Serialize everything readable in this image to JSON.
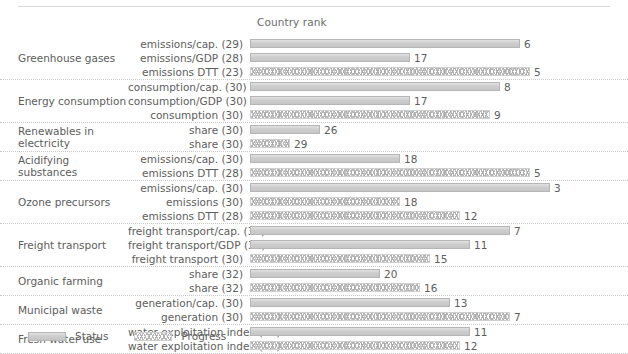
{
  "header": {
    "column_title": "Country rank"
  },
  "legend": {
    "status_label": "Status",
    "progress_label": "Progress"
  },
  "colors": {
    "status_fill": "#cfcfcf",
    "status_border": "#b6b6b6",
    "progress_fill": "#fdfdfd",
    "progress_border": "#cfcfcf",
    "text": "#5d5d5d",
    "separator": "#c9c9c9",
    "background": "#ffffff"
  },
  "chart_data": {
    "type": "bar",
    "title": "",
    "xlabel": "Country rank",
    "ylabel": "",
    "orientation": "horizontal",
    "grid": false,
    "legend_position": "bottom-left",
    "rank_scale_note": "Bar length is inverted: a better (lower) rank draws a longer bar.",
    "xlim": [
      33,
      1
    ],
    "series": [
      {
        "name": "Status",
        "style": "solid"
      },
      {
        "name": "Progress",
        "style": "chevron"
      }
    ],
    "groups": [
      {
        "group": "Greenhouse gases",
        "rows": [
          {
            "label": "emissions/cap. (29)",
            "indicator": "emissions/cap.",
            "total": 29,
            "value": 6,
            "series": "Status"
          },
          {
            "label": "emissions/GDP (28)",
            "indicator": "emissions/GDP",
            "total": 28,
            "value": 17,
            "series": "Status"
          },
          {
            "label": "emissions DTT (23)",
            "indicator": "emissions DTT",
            "total": 23,
            "value": 5,
            "series": "Progress"
          }
        ]
      },
      {
        "group": "Energy consumption",
        "rows": [
          {
            "label": "consumption/cap. (30)",
            "indicator": "consumption/cap.",
            "total": 30,
            "value": 8,
            "series": "Status"
          },
          {
            "label": "consumption/GDP (30)",
            "indicator": "consumption/GDP",
            "total": 30,
            "value": 17,
            "series": "Status"
          },
          {
            "label": "consumption (30)",
            "indicator": "consumption",
            "total": 30,
            "value": 9,
            "series": "Progress"
          }
        ]
      },
      {
        "group": "Renewables in electricity",
        "rows": [
          {
            "label": "share (30)",
            "indicator": "share",
            "total": 30,
            "value": 26,
            "series": "Status"
          },
          {
            "label": "share (30)",
            "indicator": "share",
            "total": 30,
            "value": 29,
            "series": "Progress"
          }
        ]
      },
      {
        "group": "Acidifying substances",
        "rows": [
          {
            "label": "emissions/cap. (30)",
            "indicator": "emissions/cap.",
            "total": 30,
            "value": 18,
            "series": "Status"
          },
          {
            "label": "emissions DTT (28)",
            "indicator": "emissions DTT",
            "total": 28,
            "value": 5,
            "series": "Progress"
          }
        ]
      },
      {
        "group": "Ozone precursors",
        "rows": [
          {
            "label": "emissions/cap. (30)",
            "indicator": "emissions/cap.",
            "total": 30,
            "value": 3,
            "series": "Status"
          },
          {
            "label": "emissions (30)",
            "indicator": "emissions",
            "total": 30,
            "value": 18,
            "series": "Progress"
          },
          {
            "label": "emissions DTT (28)",
            "indicator": "emissions DTT",
            "total": 28,
            "value": 12,
            "series": "Progress"
          }
        ]
      },
      {
        "group": "Freight transport",
        "rows": [
          {
            "label": "freight transport/cap. (30)",
            "indicator": "freight transport/cap.",
            "total": 30,
            "value": 7,
            "series": "Status"
          },
          {
            "label": "freight transport/GDP (30)",
            "indicator": "freight transport/GDP",
            "total": 30,
            "value": 11,
            "series": "Status"
          },
          {
            "label": "freight transport (30)",
            "indicator": "freight transport",
            "total": 30,
            "value": 15,
            "series": "Progress"
          }
        ]
      },
      {
        "group": "Organic farming",
        "rows": [
          {
            "label": "share (32)",
            "indicator": "share",
            "total": 32,
            "value": 20,
            "series": "Status"
          },
          {
            "label": "share (32)",
            "indicator": "share",
            "total": 32,
            "value": 16,
            "series": "Progress"
          }
        ]
      },
      {
        "group": "Municipal waste",
        "rows": [
          {
            "label": "generation/cap. (30)",
            "indicator": "generation/cap.",
            "total": 30,
            "value": 13,
            "series": "Status"
          },
          {
            "label": "generation (30)",
            "indicator": "generation",
            "total": 30,
            "value": 7,
            "series": "Progress"
          }
        ]
      },
      {
        "group": "Fresh water use",
        "rows": [
          {
            "label": "water exploitation index (28)",
            "indicator": "water exploitation index",
            "total": 28,
            "value": 11,
            "series": "Status"
          },
          {
            "label": "water exploitation index (25)",
            "indicator": "water exploitation index",
            "total": 25,
            "value": 12,
            "series": "Progress"
          }
        ]
      }
    ]
  }
}
